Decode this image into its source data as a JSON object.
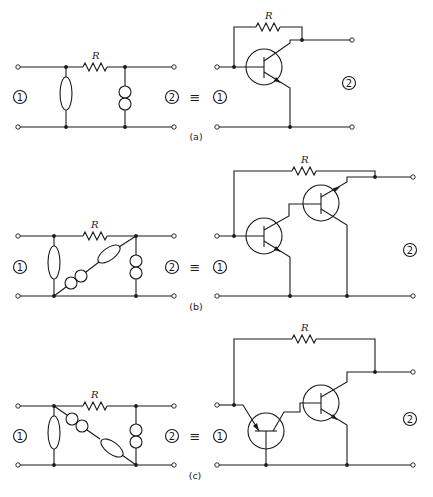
{
  "figure": {
    "panels": [
      {
        "id": "a",
        "label": "(a)",
        "resistor_label": "R",
        "port_left": "1",
        "port_right": "2",
        "equivalence": "≡",
        "equiv_resistor_label": "R",
        "equiv_port_left": "1",
        "equiv_port_right": "2",
        "left_network": [
          "shunt-ellipse",
          "series-resistor R",
          "shunt-double-circle"
        ],
        "right_circuit": [
          "npn-transistor",
          "feedback-resistor R (collector to base)"
        ]
      },
      {
        "id": "b",
        "label": "(b)",
        "resistor_label": "R",
        "port_left": "1",
        "port_right": "2",
        "equivalence": "≡",
        "equiv_resistor_label": "R",
        "equiv_port_left": "1",
        "equiv_port_right": "2",
        "left_network": [
          "shunt-ellipse",
          "series-resistor R",
          "diagonal double-circle + ellipse",
          "shunt-double-circle"
        ],
        "right_circuit": [
          "npn-transistor",
          "npn-transistor (cascaded)",
          "feedback-resistor R"
        ]
      },
      {
        "id": "c",
        "label": "(c)",
        "resistor_label": "R",
        "port_left": "1",
        "port_right": "2",
        "equivalence": "≡",
        "equiv_resistor_label": "R",
        "equiv_port_left": "1",
        "equiv_port_right": "2",
        "left_network": [
          "shunt-ellipse",
          "series-resistor R",
          "diagonal double-circle + ellipse",
          "shunt-double-circle"
        ],
        "right_circuit": [
          "common-base transistor",
          "npn-transistor",
          "feedback-resistor R"
        ]
      }
    ]
  }
}
